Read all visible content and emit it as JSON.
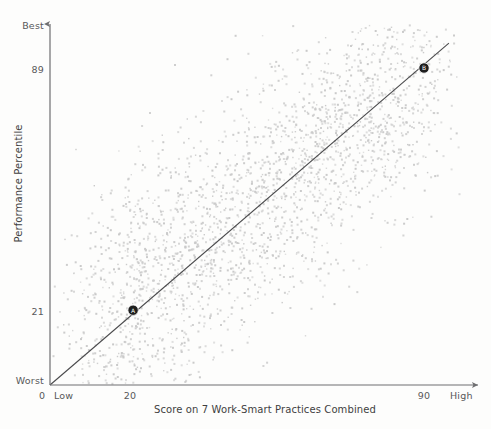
{
  "chart_data": {
    "type": "scatter",
    "title": "",
    "xlabel": "Score on 7 Work-Smart Practices Combined",
    "ylabel": "Performance Percentile",
    "xlim": [
      0,
      100
    ],
    "ylim": [
      0,
      100
    ],
    "grid": false,
    "legend": null,
    "x_ticks": [
      {
        "value": 0,
        "label": "0"
      },
      {
        "value": 0,
        "label": "Low"
      },
      {
        "value": 20,
        "label": "20"
      },
      {
        "value": 90,
        "label": "90"
      },
      {
        "value": 100,
        "label": "High"
      }
    ],
    "y_ticks": [
      {
        "value": 100,
        "label": "Best"
      },
      {
        "value": 89,
        "label": "89"
      },
      {
        "value": 21,
        "label": "21"
      },
      {
        "value": 0,
        "label": "Worst"
      }
    ],
    "trend_line": {
      "description": "diagonal regression line from origin to upper right",
      "x0": 0,
      "y0": 0,
      "x1": 96,
      "y1": 96,
      "color": "#4a4a4c"
    },
    "point_color": "#c9c9c9",
    "point_count": 2500,
    "highlighted_points": [
      {
        "x": 20,
        "y": 21,
        "label": "A",
        "color": "#1e1e1e"
      },
      {
        "x": 90,
        "y": 89,
        "label": "B",
        "color": "#1e1e1e"
      }
    ],
    "axis_color": "#6e6e70",
    "background": "#fdfdfc"
  },
  "axes": {
    "y_title": "Performance Percentile",
    "x_title": "Score on 7 Work-Smart Practices Combined",
    "y_best": "Best",
    "y_89": "89",
    "y_21": "21",
    "y_worst": "Worst",
    "x_zero": "0",
    "x_low": "Low",
    "x_20": "20",
    "x_90": "90",
    "x_high": "High"
  }
}
